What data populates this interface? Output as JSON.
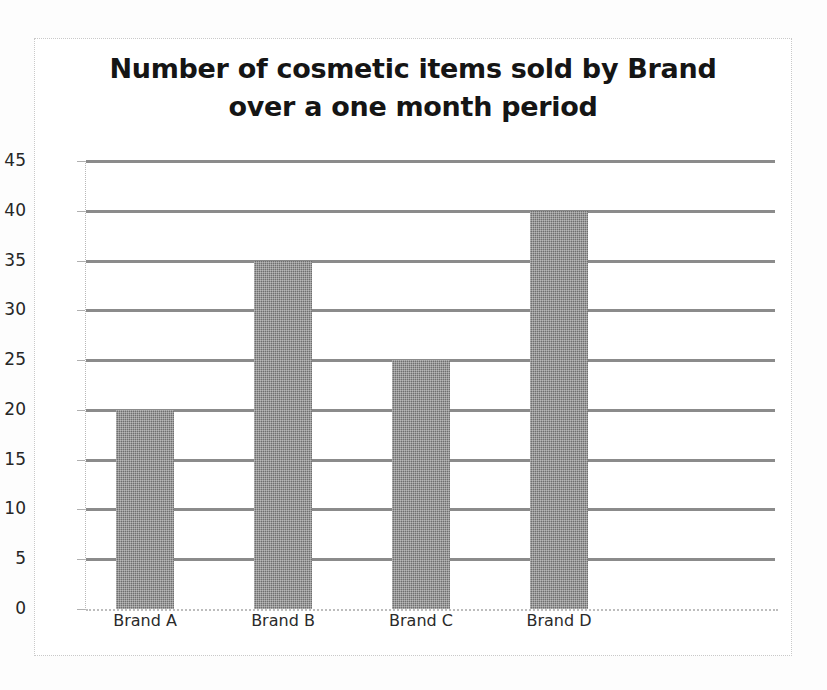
{
  "chart_data": {
    "type": "bar",
    "title": "Number of cosmetic items sold by Brand\nover a one month period",
    "categories": [
      "Brand A",
      "Brand B",
      "Brand C",
      "Brand D"
    ],
    "values": [
      20,
      35,
      25,
      40
    ],
    "xlabel": "",
    "ylabel": "",
    "ylim": [
      0,
      45
    ],
    "ytick_step": 5,
    "yticks": [
      45,
      40,
      35,
      30,
      25,
      20,
      15,
      10,
      5,
      0
    ],
    "grid": true,
    "legend": false,
    "bar_color": "#6f6f6f",
    "gridline_color": "#8b8b8b",
    "background_color": "#ffffff",
    "frame_color": "#c9c9c9"
  },
  "chart": {
    "title_line1": "Number of cosmetic items sold by Brand",
    "title_line2": "over a one month period"
  }
}
